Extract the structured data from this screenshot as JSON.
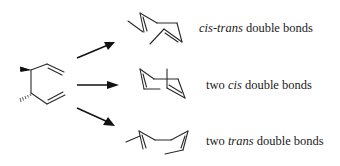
{
  "diagram": {
    "type": "reaction-scheme",
    "reactant": {
      "name": "dimethyl-substituted 1,5-hexadiene (cis-3,4-dimethylhexa-1,5-diene)",
      "stereo_bonds": [
        "wedge",
        "hash"
      ]
    },
    "arrows": [
      "arrow-to-product-1",
      "arrow-to-product-2",
      "arrow-to-product-3"
    ],
    "products": [
      {
        "id": "product-1",
        "label_prefix": "",
        "label_italic": "cis-trans",
        "label_suffix": " double bonds"
      },
      {
        "id": "product-2",
        "label_prefix": "two ",
        "label_italic": "cis",
        "label_suffix": " double bonds"
      },
      {
        "id": "product-3",
        "label_prefix": "two ",
        "label_italic": "trans",
        "label_suffix": " double bonds"
      }
    ]
  },
  "colors": {
    "ink": "#1a1a1a",
    "background": "#ffffff"
  }
}
